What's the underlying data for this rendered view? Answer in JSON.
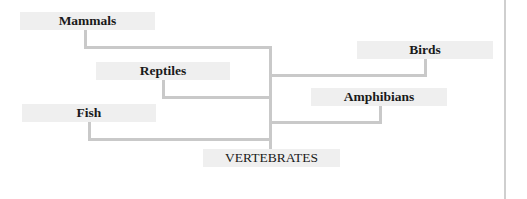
{
  "diagram": {
    "type": "tree",
    "root": "VERTEBRATES",
    "nodes": [
      {
        "id": "mammals",
        "label": "Mammals"
      },
      {
        "id": "reptiles",
        "label": "Reptiles"
      },
      {
        "id": "fish",
        "label": "Fish"
      },
      {
        "id": "birds",
        "label": "Birds"
      },
      {
        "id": "amphibians",
        "label": "Amphibians"
      },
      {
        "id": "vertebrates",
        "label": "VERTEBRATES"
      }
    ],
    "edges": [
      {
        "from": "vertebrates",
        "to": "mammals"
      },
      {
        "from": "vertebrates",
        "to": "reptiles"
      },
      {
        "from": "vertebrates",
        "to": "fish"
      },
      {
        "from": "vertebrates",
        "to": "birds"
      },
      {
        "from": "vertebrates",
        "to": "amphibians"
      }
    ],
    "colors": {
      "box_fill": "#efefef",
      "connector": "#c9c9c9",
      "text": "#1a1a1a"
    }
  }
}
